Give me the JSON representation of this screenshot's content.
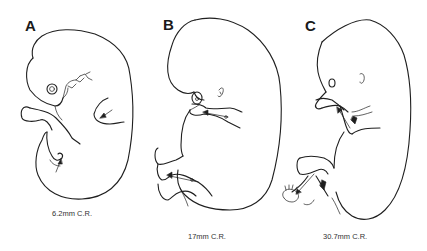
{
  "figure": {
    "panels": [
      {
        "id": "A",
        "label": "A",
        "caption": "6.2mm C.R."
      },
      {
        "id": "B",
        "label": "B",
        "caption": "17mm C.R."
      },
      {
        "id": "C",
        "label": "C",
        "caption": "30.7mm C.R."
      }
    ],
    "colors": {
      "line": "#1f1f1f",
      "background": "#ffffff",
      "text": "#333333"
    }
  }
}
